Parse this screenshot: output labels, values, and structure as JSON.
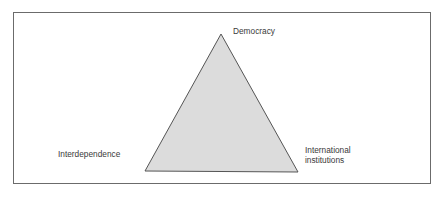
{
  "diagram": {
    "type": "triangle",
    "vertices": {
      "top": "Democracy",
      "left": "Interdependence",
      "right_line1": "International",
      "right_line2": "institutions"
    },
    "colors": {
      "fill": "#dcdcdc",
      "stroke": "#555555",
      "frame": "#6b6b6b"
    }
  }
}
